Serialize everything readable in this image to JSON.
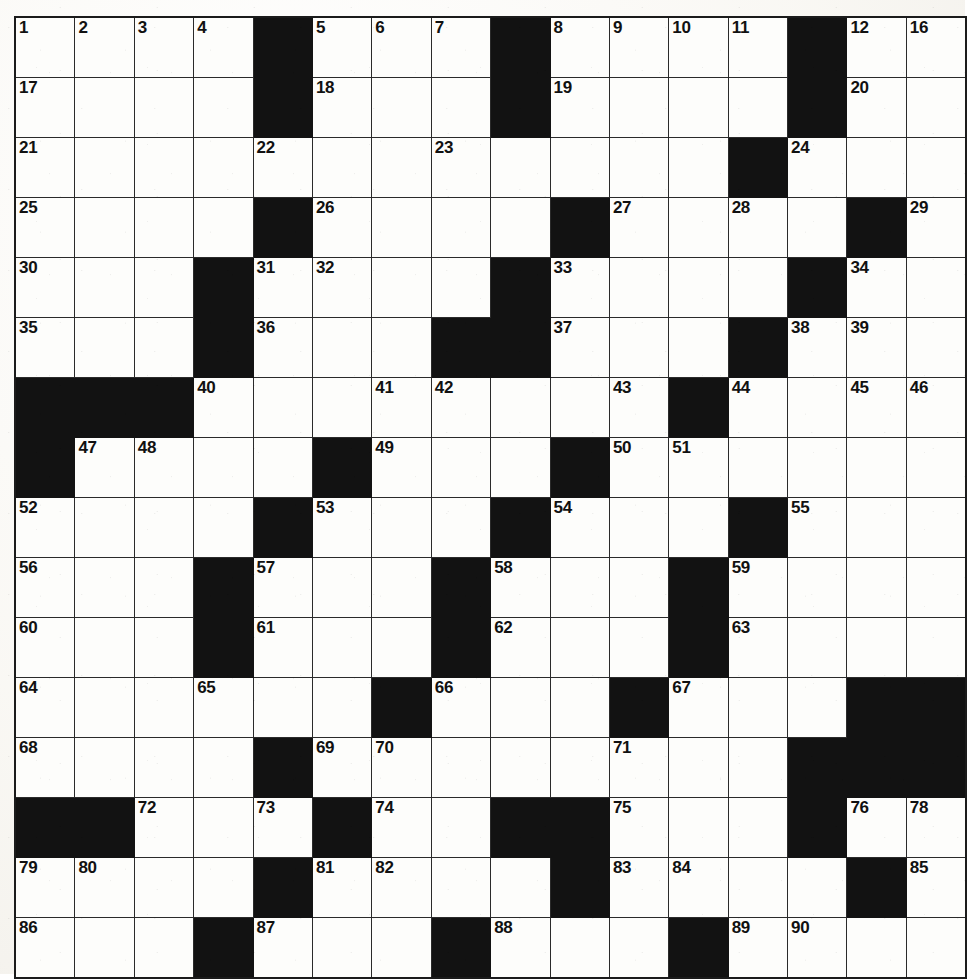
{
  "puzzle": {
    "kind": "crossword-grid",
    "rows": 16,
    "columns": 16,
    "colors": {
      "block": "#121212",
      "cell": "#fdfdfb",
      "grid_line": "#2a2a2a",
      "border": "#1b1b1b",
      "number_text": "#111111",
      "paper": "#fbfaf7"
    },
    "highest_clue_number": 103,
    "grid": [
      [
        {
          "n": "1"
        },
        {
          "n": "2"
        },
        {
          "n": "3"
        },
        {
          "n": "4"
        },
        {
          "b": true
        },
        {
          "n": "5"
        },
        {
          "n": "6"
        },
        {
          "n": "7"
        },
        {
          "b": true
        },
        {
          "n": "8"
        },
        {
          "n": "9"
        },
        {
          "n": "10"
        },
        {
          "n": "11"
        },
        {
          "b": true
        },
        {
          "n": "12"
        },
        {
          "n": "13"
        }
      ],
      [
        {
          "n": "17"
        },
        {},
        {},
        {},
        {
          "b": true
        },
        {
          "n": "18"
        },
        {},
        {},
        {
          "b": true
        },
        {
          "n": "19"
        },
        {},
        {},
        {},
        {
          "b": true
        },
        {
          "n": "20"
        },
        {}
      ],
      [
        {
          "n": "21"
        },
        {},
        {},
        {},
        {
          "n": "22"
        },
        {},
        {},
        {
          "n": "23"
        },
        {},
        {},
        {},
        {},
        {
          "b": true
        },
        {
          "n": "24"
        },
        {},
        {}
      ],
      [
        {
          "n": "25"
        },
        {},
        {},
        {},
        {
          "b": true
        },
        {
          "n": "26"
        },
        {},
        {},
        {},
        {
          "b": true
        },
        {
          "n": "27"
        },
        {},
        {
          "n": "28"
        },
        {},
        {
          "b": true
        },
        {
          "n": "29"
        }
      ],
      [
        {
          "n": "30"
        },
        {},
        {},
        {
          "b": true
        },
        {
          "n": "31"
        },
        {
          "n": "32"
        },
        {},
        {},
        {
          "b": true
        },
        {
          "n": "33"
        },
        {},
        {},
        {},
        {
          "b": true
        },
        {
          "n": "34"
        },
        {}
      ],
      [
        {
          "n": "35"
        },
        {},
        {},
        {
          "b": true
        },
        {
          "n": "36"
        },
        {},
        {},
        {
          "b": true
        },
        {
          "b": true
        },
        {
          "n": "37"
        },
        {},
        {},
        {
          "b": true
        },
        {
          "n": "38"
        },
        {
          "n": "39"
        },
        {}
      ],
      [
        {
          "b": true
        },
        {
          "b": true
        },
        {
          "b": true
        },
        {
          "n": "40"
        },
        {},
        {},
        {
          "n": "41"
        },
        {
          "n": "42"
        },
        {},
        {},
        {
          "n": "43"
        },
        {
          "b": true
        },
        {
          "n": "44"
        },
        {},
        {
          "b": true
        },
        {
          "b": true
        }
      ],
      [
        {
          "b": true
        },
        {
          "n": "47"
        },
        {
          "n": "48"
        },
        {},
        {},
        {
          "b": true
        },
        {
          "n": "49"
        },
        {},
        {},
        {
          "b": true
        },
        {
          "n": "50"
        },
        {
          "n": "51"
        },
        {},
        {},
        {},
        {}
      ],
      [
        {
          "n": "52"
        },
        {},
        {},
        {},
        {
          "b": true
        },
        {
          "n": "53"
        },
        {},
        {},
        {
          "b": true
        },
        {
          "n": "54"
        },
        {},
        {},
        {
          "b": true
        },
        {
          "n": "55"
        },
        {},
        {}
      ],
      [
        {
          "n": "56"
        },
        {},
        {},
        {
          "b": true
        },
        {
          "n": "57"
        },
        {},
        {},
        {
          "b": true
        },
        {
          "n": "58"
        },
        {},
        {},
        {
          "b": true
        },
        {
          "n": "59"
        },
        {},
        {},
        {}
      ],
      [
        {
          "n": "60"
        },
        {},
        {},
        {
          "b": true
        },
        {
          "n": "61"
        },
        {},
        {},
        {
          "b": true
        },
        {
          "n": "62"
        },
        {},
        {},
        {
          "b": true
        },
        {
          "n": "63"
        },
        {},
        {},
        {}
      ],
      [
        {
          "n": "64"
        },
        {},
        {},
        {
          "n": "65"
        },
        {},
        {},
        {
          "b": true
        },
        {
          "n": "66"
        },
        {},
        {},
        {
          "b": true
        },
        {
          "n": "67"
        },
        {},
        {},
        {
          "b": true
        },
        {
          "b": true
        }
      ],
      [
        {
          "n": "68"
        },
        {},
        {},
        {},
        {
          "b": true
        },
        {
          "n": "69"
        },
        {
          "n": "70"
        },
        {},
        {},
        {},
        {
          "n": "71"
        },
        {},
        {},
        {
          "b": true
        },
        {
          "b": true
        },
        {
          "b": true
        }
      ],
      [
        {
          "b": true
        },
        {
          "b": true
        },
        {
          "n": "72"
        },
        {},
        {
          "n": "73"
        },
        {
          "b": true
        },
        {
          "n": "74"
        },
        {},
        {
          "b": true
        },
        {
          "b": true
        },
        {
          "n": "75"
        },
        {},
        {},
        {
          "b": true
        },
        {
          "n": "76"
        },
        {
          "n": "77"
        }
      ],
      [
        {
          "n": "79"
        },
        {
          "n": "80"
        },
        {},
        {},
        {
          "b": true
        },
        {
          "n": "81"
        },
        {
          "n": "82"
        },
        {},
        {},
        {
          "b": true
        },
        {
          "n": "83"
        },
        {
          "n": "84"
        },
        {},
        {},
        {
          "b": true
        },
        {
          "n": "85"
        }
      ],
      [
        {
          "n": "86"
        },
        {},
        {},
        {
          "b": true
        },
        {
          "n": "87"
        },
        {},
        {},
        {
          "b": true
        },
        {
          "n": "88"
        },
        {},
        {},
        {
          "b": true
        },
        {
          "n": "89"
        },
        {
          "n": "90"
        },
        {},
        {}
      ]
    ],
    "grid_extra_columns": {
      "note": "column 16 values for rows listed by index",
      "row1_col16": "16",
      "row7_col15": "45",
      "row7_col16": "46",
      "row14_col16": "78"
    },
    "trailing_rows": [
      [
        {
          "n": "91"
        },
        {},
        {},
        {
          "n": "92"
        },
        {},
        {
          "b": true
        },
        {
          "n": "93"
        },
        {},
        {
          "n": "94"
        },
        {},
        {},
        {
          "n": "95"
        },
        {},
        {},
        {},
        {}
      ],
      [
        {
          "n": "96"
        },
        {},
        {},
        {},
        {},
        {
          "b": true
        },
        {
          "n": "97"
        },
        {},
        {},
        {
          "b": true
        },
        {
          "n": "98"
        },
        {},
        {
          "b": true
        },
        {
          "n": "99"
        },
        {},
        {}
      ],
      [
        {
          "n": "100"
        },
        {},
        {},
        {},
        {},
        {
          "b": true
        },
        {
          "n": "101"
        },
        {},
        {},
        {
          "b": true
        },
        {
          "n": "102"
        },
        {},
        {
          "b": true
        },
        {
          "n": "103"
        },
        {},
        {}
      ]
    ]
  }
}
